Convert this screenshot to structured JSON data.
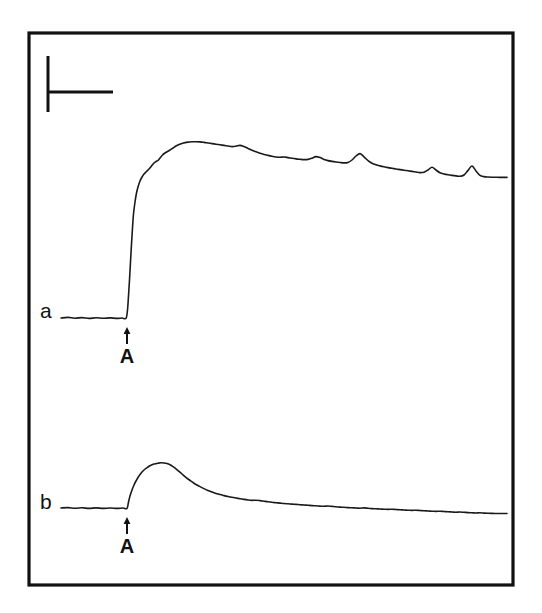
{
  "figure": {
    "type": "recording-traces",
    "background_color": "#ffffff",
    "line_color": "#1a1a1a",
    "frame_color": "#111111",
    "frame": {
      "x": 29,
      "y": 33,
      "width": 484,
      "height": 552
    }
  },
  "scale_bar": {
    "name": "calibration-scale-bar",
    "vertical": {
      "x": 48,
      "y_top": 56,
      "y_bottom": 112
    },
    "horizontal": {
      "y": 92,
      "x_left": 49,
      "x_right": 113
    },
    "vertical_label": "",
    "horizontal_label": ""
  },
  "panels": [
    {
      "id": "a",
      "label": "a",
      "label_x": 40,
      "label_y": 318,
      "baseline_y": 318,
      "event_marker": {
        "label": "A",
        "arrow_x": 127,
        "arrow_top_y": 327,
        "arrow_bottom_y": 344,
        "label_x": 127,
        "label_y": 363
      },
      "description": "Sustained response: rapid rise to plateau with slow partial decline and small transient spikes"
    },
    {
      "id": "b",
      "label": "b",
      "label_x": 40,
      "label_y": 509,
      "baseline_y": 508,
      "event_marker": {
        "label": "A",
        "arrow_x": 127,
        "arrow_top_y": 517,
        "arrow_bottom_y": 534,
        "label_x": 127,
        "label_y": 553
      },
      "description": "Transient response: fast rise to a peak followed by exponential decay back toward baseline"
    }
  ],
  "chart_data": {
    "type": "line",
    "title": "",
    "xlabel": "",
    "ylabel": "",
    "grid": false,
    "legend": "none",
    "axis_visible": false,
    "annotations": [
      {
        "text": "a",
        "x": 40,
        "y": 318,
        "role": "trace-label"
      },
      {
        "text": "A",
        "x": 127,
        "y": 363,
        "role": "stimulus-onset-label"
      },
      {
        "text": "b",
        "x": 40,
        "y": 509,
        "role": "trace-label"
      },
      {
        "text": "A",
        "x": 127,
        "y": 553,
        "role": "stimulus-onset-label"
      }
    ],
    "series": [
      {
        "name": "a",
        "kind": "sustained",
        "stimulus_x": 127,
        "baseline_y": 318,
        "points": [
          [
            61,
            318
          ],
          [
            68,
            317.4
          ],
          [
            75,
            318.2
          ],
          [
            82,
            317.6
          ],
          [
            89,
            318.4
          ],
          [
            96,
            317.8
          ],
          [
            103,
            318.3
          ],
          [
            110,
            317.9
          ],
          [
            117,
            318.4
          ],
          [
            122,
            318.0
          ],
          [
            126,
            318.3
          ],
          [
            127.5,
            310
          ],
          [
            128.5,
            296
          ],
          [
            129.5,
            280
          ],
          [
            130.5,
            262
          ],
          [
            131.5,
            244
          ],
          [
            132.5,
            228
          ],
          [
            133.5,
            214
          ],
          [
            135,
            202
          ],
          [
            136.5,
            193
          ],
          [
            138,
            187
          ],
          [
            140,
            181
          ],
          [
            142,
            177
          ],
          [
            144,
            174
          ],
          [
            146.5,
            171.5
          ],
          [
            149,
            169
          ],
          [
            151.5,
            166
          ],
          [
            154,
            163
          ],
          [
            156,
            161.5
          ],
          [
            158,
            160.5
          ],
          [
            160,
            158
          ],
          [
            162.5,
            155
          ],
          [
            165,
            153
          ],
          [
            167.5,
            151.5
          ],
          [
            170,
            150
          ],
          [
            173,
            148
          ],
          [
            176,
            146
          ],
          [
            179,
            144.5
          ],
          [
            182,
            143.4
          ],
          [
            185,
            142.6
          ],
          [
            188,
            142.1
          ],
          [
            192,
            141.8
          ],
          [
            196,
            141.7
          ],
          [
            200,
            141.9
          ],
          [
            204,
            142.4
          ],
          [
            208,
            143.0
          ],
          [
            212,
            143.6
          ],
          [
            216,
            144.2
          ],
          [
            220,
            144.8
          ],
          [
            224,
            145.4
          ],
          [
            228,
            146.0
          ],
          [
            232,
            146.6
          ],
          [
            236,
            146.2
          ],
          [
            240,
            145.4
          ],
          [
            244,
            146.6
          ],
          [
            248,
            148.4
          ],
          [
            252,
            150.2
          ],
          [
            256,
            151.8
          ],
          [
            260,
            153.2
          ],
          [
            264,
            154.4
          ],
          [
            268,
            155.4
          ],
          [
            272,
            156.3
          ],
          [
            276,
            157.0
          ],
          [
            280,
            157.3
          ],
          [
            284,
            157.0
          ],
          [
            288,
            157.6
          ],
          [
            292,
            158.3
          ],
          [
            296,
            158.9
          ],
          [
            300,
            159.3
          ],
          [
            304,
            159.6
          ],
          [
            308,
            159.4
          ],
          [
            312,
            158.2
          ],
          [
            316,
            156.6
          ],
          [
            320,
            157.6
          ],
          [
            324,
            159.4
          ],
          [
            328,
            160.6
          ],
          [
            332,
            161.4
          ],
          [
            336,
            162.0
          ],
          [
            340,
            162.5
          ],
          [
            344,
            162.9
          ],
          [
            348,
            162.4
          ],
          [
            352,
            160.0
          ],
          [
            356,
            156.0
          ],
          [
            360,
            153.6
          ],
          [
            364,
            156.8
          ],
          [
            368,
            160.6
          ],
          [
            372,
            163.2
          ],
          [
            376,
            164.8
          ],
          [
            380,
            165.9
          ],
          [
            384,
            166.8
          ],
          [
            388,
            167.6
          ],
          [
            392,
            168.3
          ],
          [
            396,
            169.0
          ],
          [
            400,
            169.6
          ],
          [
            404,
            170.2
          ],
          [
            408,
            170.8
          ],
          [
            412,
            171.4
          ],
          [
            416,
            172.0
          ],
          [
            420,
            172.6
          ],
          [
            424,
            172.2
          ],
          [
            428,
            170.0
          ],
          [
            432,
            167.2
          ],
          [
            436,
            170.0
          ],
          [
            440,
            172.8
          ],
          [
            444,
            174.0
          ],
          [
            448,
            174.8
          ],
          [
            452,
            175.4
          ],
          [
            456,
            175.9
          ],
          [
            460,
            176.3
          ],
          [
            464,
            175.0
          ],
          [
            468,
            170.4
          ],
          [
            472,
            166.0
          ],
          [
            476,
            171.0
          ],
          [
            480,
            175.4
          ],
          [
            484,
            176.6
          ],
          [
            488,
            177.0
          ],
          [
            492,
            177.2
          ],
          [
            497,
            177.3
          ],
          [
            502,
            177.4
          ],
          [
            507,
            177.4
          ]
        ]
      },
      {
        "name": "b",
        "kind": "transient",
        "stimulus_x": 128,
        "baseline_y": 508,
        "points": [
          [
            61,
            508
          ],
          [
            68,
            507.6
          ],
          [
            75,
            508.3
          ],
          [
            82,
            507.8
          ],
          [
            89,
            508.4
          ],
          [
            96,
            507.9
          ],
          [
            103,
            508.4
          ],
          [
            110,
            508.0
          ],
          [
            117,
            508.4
          ],
          [
            123,
            508.0
          ],
          [
            127,
            508.4
          ],
          [
            128.5,
            502
          ],
          [
            130,
            496
          ],
          [
            132,
            490
          ],
          [
            134,
            485
          ],
          [
            136,
            481
          ],
          [
            138,
            477.5
          ],
          [
            140,
            474.5
          ],
          [
            142,
            472
          ],
          [
            144,
            470
          ],
          [
            146,
            468.4
          ],
          [
            148,
            467
          ],
          [
            150,
            465.8
          ],
          [
            152,
            464.8
          ],
          [
            154,
            464.0
          ],
          [
            156,
            463.6
          ],
          [
            158,
            463.2
          ],
          [
            161,
            462.8
          ],
          [
            164,
            463.0
          ],
          [
            167,
            463.6
          ],
          [
            170,
            464.8
          ],
          [
            173,
            466.6
          ],
          [
            176,
            468.8
          ],
          [
            179,
            471.4
          ],
          [
            182,
            474.0
          ],
          [
            185,
            476.6
          ],
          [
            188,
            479.0
          ],
          [
            191,
            481.2
          ],
          [
            194,
            483.2
          ],
          [
            197,
            485.0
          ],
          [
            200,
            486.6
          ],
          [
            204,
            488.6
          ],
          [
            208,
            490.4
          ],
          [
            212,
            492.0
          ],
          [
            216,
            493.4
          ],
          [
            220,
            494.6
          ],
          [
            224,
            495.6
          ],
          [
            228,
            496.5
          ],
          [
            232,
            497.3
          ],
          [
            236,
            498.0
          ],
          [
            240,
            498.7
          ],
          [
            244,
            499.4
          ],
          [
            248,
            500.0
          ],
          [
            252,
            500.4
          ],
          [
            256,
            500.2
          ],
          [
            260,
            500.6
          ],
          [
            264,
            501.2
          ],
          [
            268,
            501.8
          ],
          [
            272,
            502.3
          ],
          [
            276,
            502.7
          ],
          [
            280,
            503.1
          ],
          [
            284,
            503.5
          ],
          [
            288,
            503.8
          ],
          [
            292,
            504.1
          ],
          [
            296,
            504.4
          ],
          [
            300,
            504.7
          ],
          [
            304,
            505.0
          ],
          [
            308,
            505.3
          ],
          [
            312,
            505.6
          ],
          [
            316,
            505.8
          ],
          [
            320,
            506.1
          ],
          [
            324,
            506.3
          ],
          [
            328,
            506.0
          ],
          [
            332,
            506.4
          ],
          [
            336,
            506.8
          ],
          [
            340,
            507.1
          ],
          [
            344,
            507.3
          ],
          [
            348,
            507.6
          ],
          [
            352,
            507.8
          ],
          [
            356,
            508.0
          ],
          [
            360,
            508.2
          ],
          [
            364,
            507.9
          ],
          [
            368,
            508.3
          ],
          [
            372,
            508.6
          ],
          [
            376,
            508.8
          ],
          [
            380,
            509.0
          ],
          [
            384,
            509.2
          ],
          [
            388,
            509.4
          ],
          [
            392,
            509.2
          ],
          [
            396,
            509.5
          ],
          [
            400,
            509.8
          ],
          [
            404,
            510.0
          ],
          [
            408,
            510.2
          ],
          [
            412,
            510.4
          ],
          [
            416,
            510.2
          ],
          [
            420,
            510.5
          ],
          [
            424,
            510.8
          ],
          [
            428,
            511.0
          ],
          [
            432,
            511.2
          ],
          [
            436,
            511.4
          ],
          [
            440,
            511.2
          ],
          [
            444,
            511.5
          ],
          [
            448,
            511.8
          ],
          [
            452,
            512.0
          ],
          [
            456,
            512.2
          ],
          [
            460,
            512.0
          ],
          [
            464,
            512.3
          ],
          [
            468,
            512.6
          ],
          [
            472,
            512.8
          ],
          [
            476,
            513.0
          ],
          [
            480,
            512.8
          ],
          [
            484,
            513.1
          ],
          [
            488,
            513.3
          ],
          [
            492,
            513.4
          ],
          [
            497,
            513.5
          ],
          [
            502,
            513.5
          ],
          [
            507,
            513.5
          ]
        ]
      }
    ]
  }
}
